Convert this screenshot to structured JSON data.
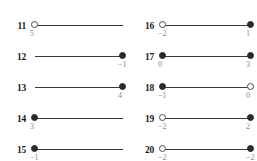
{
  "page": {
    "columns": 2,
    "accent_color": "#2b2b2b",
    "label_color": "#8a8a8a",
    "index_color": "#1a1a1a",
    "line_color": "#3a3a3a"
  },
  "legend": {
    "filled_meaning": "closed endpoint (inclusive)",
    "open_meaning": "open endpoint (exclusive)"
  },
  "chart_data": {
    "type": "number-line",
    "title": "",
    "xlabel": "",
    "ylabel": "",
    "grid": false,
    "legend_position": "none",
    "marker_types": [
      "filled",
      "open",
      "none"
    ],
    "items": [
      {
        "index": "11",
        "left": {
          "marker": "open",
          "value": "5",
          "x": 0.0
        },
        "right": {
          "marker": "none",
          "value": "",
          "x": 1.0
        }
      },
      {
        "index": "12",
        "left": {
          "marker": "none",
          "value": "",
          "x": 0.0
        },
        "right": {
          "marker": "filled",
          "value": "−1",
          "x": 1.0
        }
      },
      {
        "index": "13",
        "left": {
          "marker": "none",
          "value": "",
          "x": 0.0
        },
        "right": {
          "marker": "filled",
          "value": "4",
          "x": 1.0
        }
      },
      {
        "index": "14",
        "left": {
          "marker": "filled",
          "value": "3",
          "x": 0.0
        },
        "right": {
          "marker": "none",
          "value": "",
          "x": 1.0
        }
      },
      {
        "index": "15",
        "left": {
          "marker": "filled",
          "value": "−1",
          "x": 0.0
        },
        "right": {
          "marker": "none",
          "value": "",
          "x": 1.0
        }
      },
      {
        "index": "16",
        "left": {
          "marker": "open",
          "value": "−2",
          "x": 0.0
        },
        "right": {
          "marker": "filled",
          "value": "1",
          "x": 1.0
        }
      },
      {
        "index": "17",
        "left": {
          "marker": "filled",
          "value": "0",
          "x": 0.0
        },
        "right": {
          "marker": "filled",
          "value": "3",
          "x": 1.0
        }
      },
      {
        "index": "18",
        "left": {
          "marker": "filled",
          "value": "−1",
          "x": 0.0
        },
        "right": {
          "marker": "open",
          "value": "0",
          "x": 1.0
        }
      },
      {
        "index": "19",
        "left": {
          "marker": "open",
          "value": "−2",
          "x": 0.0
        },
        "right": {
          "marker": "filled",
          "value": "2",
          "x": 1.0
        }
      },
      {
        "index": "20",
        "left": {
          "marker": "open",
          "value": "−2",
          "x": 0.0
        },
        "right": {
          "marker": "filled",
          "value": "−2",
          "x": 1.0
        }
      }
    ]
  }
}
